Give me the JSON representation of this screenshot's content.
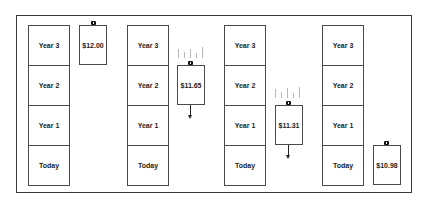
{
  "diagram": {
    "type": "price-ladder-illustration",
    "row_labels": [
      "Year 3",
      "Year 2",
      "Year 1",
      "Today"
    ],
    "columns": [
      {
        "rows": [
          "Year 3",
          "Year 2",
          "Year 1",
          "Today"
        ]
      },
      {
        "rows": [
          "Year 3",
          "Year 2",
          "Year 1",
          "Today"
        ]
      },
      {
        "rows": [
          "Year 3",
          "Year 2",
          "Year 1",
          "Today"
        ]
      },
      {
        "rows": [
          "Year 3",
          "Year 2",
          "Year 1",
          "Today"
        ]
      }
    ],
    "price_boxes": [
      {
        "label": "$12.00",
        "level": "Year 3",
        "icon": "lock-icon",
        "effect": "none"
      },
      {
        "label": "$11.65",
        "level": "Year 2",
        "icon": "lock-icon",
        "effect": "rain-down-arrow"
      },
      {
        "label": "$11.31",
        "level": "Year 1",
        "icon": "lock-icon",
        "effect": "rain-down-arrow"
      },
      {
        "label": "$10.98",
        "level": "Today",
        "icon": "lock-icon",
        "effect": "none"
      }
    ],
    "colors": {
      "border": "#4a4a4a",
      "frame": "#3a3a3a",
      "rain": "#b8b8b8",
      "text": "#222222",
      "lock": "#111111"
    }
  }
}
